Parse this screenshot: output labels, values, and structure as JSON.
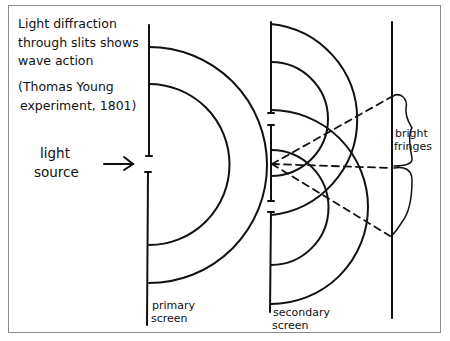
{
  "diagram": {
    "title_lines": [
      "Light diffraction",
      "through slits shows",
      "wave action",
      "(Thomas Young",
      "experiment, 1801)"
    ],
    "labels": {
      "light_source": [
        "light",
        "source"
      ],
      "primary_screen": [
        "primary",
        "screen"
      ],
      "secondary_screen": [
        "secondary",
        "screen"
      ],
      "bright_fringes": [
        "bright",
        "fringes"
      ]
    },
    "colors": {
      "ink": "#111111",
      "frame": "#8a8a8a",
      "background": "#ffffff"
    },
    "elements": {
      "primary_screen": {
        "x": 149,
        "y_top": 25,
        "y_bottom": 325,
        "slit_center_y": 164
      },
      "secondary_screen": {
        "x": 271,
        "y_top": 22,
        "y_bottom": 312,
        "slit_centers_y": [
          119,
          207
        ]
      },
      "viewing_screen": {
        "x": 392,
        "y_top": 22,
        "y_bottom": 318
      },
      "primary_wave_radii": [
        80,
        118
      ],
      "secondary_wave_radii": [
        57,
        96
      ],
      "fringe_rays_to_y": [
        96,
        168,
        236
      ]
    }
  }
}
